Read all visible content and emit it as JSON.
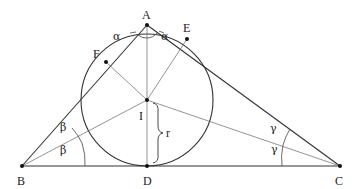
{
  "diagram": {
    "points": {
      "A": {
        "label": "A",
        "x": 147,
        "y": 25
      },
      "B": {
        "label": "B",
        "x": 22,
        "y": 166
      },
      "C": {
        "label": "C",
        "x": 340,
        "y": 166
      },
      "D": {
        "label": "D",
        "x": 147,
        "y": 166
      },
      "E": {
        "label": "E",
        "x": 187,
        "y": 39
      },
      "F": {
        "label": "F",
        "x": 106,
        "y": 62
      },
      "I": {
        "label": "I",
        "x": 147,
        "y": 100
      }
    },
    "incircle": {
      "center": "I",
      "radius_label": "r",
      "radius_px": 66
    },
    "angles": {
      "A": {
        "symbol": "α"
      },
      "B": {
        "symbol": "β"
      },
      "C": {
        "symbol": "γ"
      }
    },
    "colors": {
      "line": "#333333",
      "thin_line": "#555555",
      "text": "#222222"
    }
  }
}
